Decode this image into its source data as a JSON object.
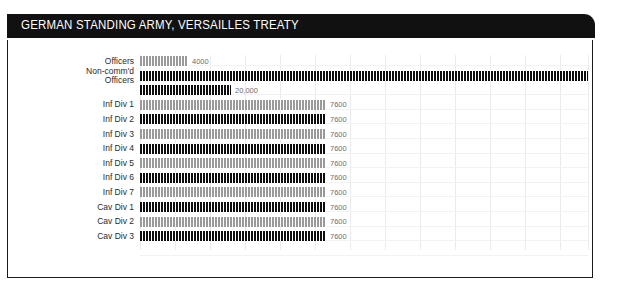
{
  "header": {
    "title": "GERMAN STANDING ARMY, VERSAILLES TREATY"
  },
  "chart_data": {
    "type": "bar",
    "title": "GERMAN STANDING ARMY, VERSAILLES TREATY",
    "subtype": "pictogram-isotype-horizontal",
    "xlabel": "",
    "ylabel": "",
    "grid": true,
    "legend": null,
    "xlim": [
      0,
      100000
    ],
    "value_unit": "troops",
    "categories": [
      "Officers",
      "Non-comm'd Officers",
      "",
      "Inf Div 1",
      "Inf Div 2",
      "Inf Div 3",
      "Inf Div 4",
      "Inf Div 5",
      "Inf Div 6",
      "Inf Div 7",
      "Cav Div 1",
      "Cav Div 2",
      "Cav Div 3"
    ],
    "values": [
      4000,
      100000,
      20000,
      7600,
      7600,
      7600,
      7600,
      7600,
      7600,
      7600,
      7600,
      7600,
      7600
    ],
    "value_labels": [
      "4000",
      "",
      "20,000",
      "7600",
      "7600",
      "7600",
      "7600",
      "7600",
      "7600",
      "7600",
      "7600",
      "7600",
      "7600"
    ],
    "colors": [
      "#9a9a9a",
      "#0d0d0d",
      "#0d0d0d",
      "#9a9a9a",
      "#0d0d0d",
      "#9a9a9a",
      "#0d0d0d",
      "#9a9a9a",
      "#0d0d0d",
      "#9a9a9a",
      "#0d0d0d",
      "#9a9a9a",
      "#0d0d0d"
    ],
    "rows": [
      {
        "label_lines": [
          "Officers"
        ],
        "value": 4000,
        "value_label": "4000",
        "shade": "light",
        "width_px": 48
      },
      {
        "label_lines": [
          "Non-comm'd",
          "Officers"
        ],
        "value": 100000,
        "value_label": "",
        "shade": "dark",
        "width_px": 448
      },
      {
        "label_lines": [],
        "value": 20000,
        "value_label": "20,000",
        "shade": "dark",
        "width_px": 91
      },
      {
        "label_lines": [
          "Inf Div 1"
        ],
        "value": 7600,
        "value_label": "7600",
        "shade": "light",
        "width_px": 186
      },
      {
        "label_lines": [
          "Inf Div 2"
        ],
        "value": 7600,
        "value_label": "7600",
        "shade": "dark",
        "width_px": 186
      },
      {
        "label_lines": [
          "Inf Div 3"
        ],
        "value": 7600,
        "value_label": "7600",
        "shade": "light",
        "width_px": 186
      },
      {
        "label_lines": [
          "Inf Div 4"
        ],
        "value": 7600,
        "value_label": "7600",
        "shade": "dark",
        "width_px": 186
      },
      {
        "label_lines": [
          "Inf Div 5"
        ],
        "value": 7600,
        "value_label": "7600",
        "shade": "light",
        "width_px": 186
      },
      {
        "label_lines": [
          "Inf Div 6"
        ],
        "value": 7600,
        "value_label": "7600",
        "shade": "dark",
        "width_px": 186
      },
      {
        "label_lines": [
          "Inf Div 7"
        ],
        "value": 7600,
        "value_label": "7600",
        "shade": "light",
        "width_px": 186
      },
      {
        "label_lines": [
          "Cav Div 1"
        ],
        "value": 7600,
        "value_label": "7600",
        "shade": "dark",
        "width_px": 186
      },
      {
        "label_lines": [
          "Cav Div 2"
        ],
        "value": 7600,
        "value_label": "7600",
        "shade": "light",
        "width_px": 186
      },
      {
        "label_lines": [
          "Cav Div 3"
        ],
        "value": 7600,
        "value_label": "7600",
        "shade": "dark",
        "width_px": 186
      }
    ],
    "colors_meta": {
      "header_background": "#111111",
      "header_text": "#ffffff",
      "bar_dark": "#0d0d0d",
      "bar_light": "#9a9a9a",
      "gridline": "#ebebeb",
      "label_text": "#2b2b2b",
      "value_text": "#6e6e6e",
      "frame_border": "#1b1b1b"
    },
    "gridlines_x_px": [
      0,
      35,
      70,
      105,
      140,
      175,
      210,
      245,
      280,
      315,
      350,
      385,
      420,
      448
    ]
  }
}
